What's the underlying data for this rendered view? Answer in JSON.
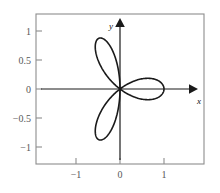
{
  "figure": {
    "title": "",
    "background_color": "#ffffff",
    "frame_color": "#8d8d8d",
    "axis_color": "#1a1a1a",
    "curve_color": "#1a1a1a",
    "x_axis_label": "x",
    "y_axis_label": "y"
  },
  "chart_data": {
    "type": "line",
    "title": "",
    "subtitle": "",
    "xlabel": "x",
    "ylabel": "y",
    "xlim": [
      -1.5,
      1.4
    ],
    "ylim": [
      -1.3,
      1.3
    ],
    "grid": false,
    "legend": null,
    "curve_name": "three-petal rose",
    "polar_equation": "r = cos(3*theta)",
    "petal_count": 3,
    "petal_tip_radius": 1,
    "petal_tip_angles_deg": [
      0,
      120,
      240
    ],
    "petal_tips_xy": [
      [
        1,
        0
      ],
      [
        -0.5,
        0.866
      ],
      [
        -0.5,
        -0.866
      ]
    ],
    "xticks": [
      -1,
      0,
      1
    ],
    "xticklabels": [
      "−1",
      "0",
      "1"
    ],
    "yticks": [
      -1,
      -0.5,
      0,
      0.5,
      1
    ],
    "yticklabels": [
      "−1",
      "−0.5",
      "0",
      "0.5",
      "1"
    ]
  },
  "ticks": {
    "x": [
      {
        "value": -1,
        "label": "−1",
        "px": 76
      },
      {
        "value": 0,
        "label": "0",
        "px": 120
      },
      {
        "value": 1,
        "label": "1",
        "px": 164
      }
    ],
    "y": [
      {
        "value": 1,
        "label": "1",
        "px": 31
      },
      {
        "value": 0.5,
        "label": "0.5",
        "px": 60
      },
      {
        "value": 0,
        "label": "0",
        "px": 89
      },
      {
        "value": -0.5,
        "label": "−0.5",
        "px": 118
      },
      {
        "value": -1,
        "label": "−1",
        "px": 147
      }
    ]
  }
}
